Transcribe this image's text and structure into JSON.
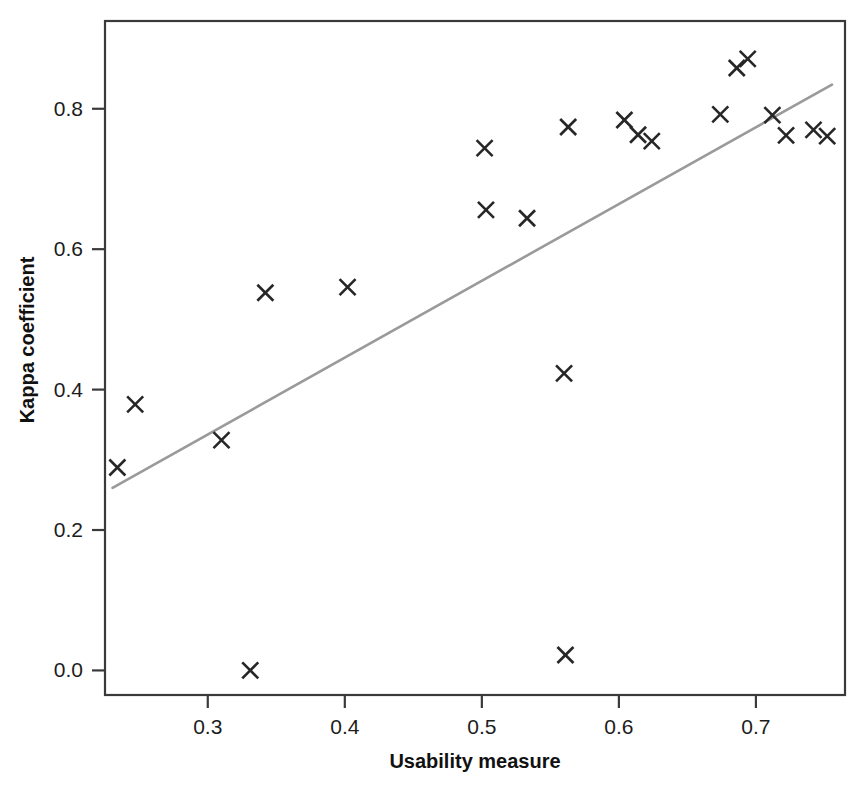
{
  "chart_data": {
    "type": "scatter",
    "title": "",
    "xlabel": "Usability measure",
    "ylabel": "Kappa coefficient",
    "xlim": [
      0.225,
      0.765
    ],
    "ylim": [
      -0.035,
      0.925
    ],
    "grid": false,
    "legend": "none",
    "xticks": [
      0.3,
      0.4,
      0.5,
      0.6,
      0.7
    ],
    "xticklabels": [
      "0.3",
      "0.4",
      "0.5",
      "0.6",
      "0.7"
    ],
    "yticks": [
      0.0,
      0.2,
      0.4,
      0.6,
      0.8
    ],
    "yticklabels": [
      "0.0",
      "0.2",
      "0.4",
      "0.6",
      "0.8"
    ],
    "marker": "x",
    "marker_color": "#262626",
    "points": [
      {
        "x": 0.234,
        "y": 0.289
      },
      {
        "x": 0.247,
        "y": 0.379
      },
      {
        "x": 0.31,
        "y": 0.328
      },
      {
        "x": 0.331,
        "y": 0.0
      },
      {
        "x": 0.342,
        "y": 0.538
      },
      {
        "x": 0.402,
        "y": 0.546
      },
      {
        "x": 0.502,
        "y": 0.744
      },
      {
        "x": 0.503,
        "y": 0.656
      },
      {
        "x": 0.533,
        "y": 0.644
      },
      {
        "x": 0.56,
        "y": 0.423
      },
      {
        "x": 0.561,
        "y": 0.022
      },
      {
        "x": 0.563,
        "y": 0.774
      },
      {
        "x": 0.604,
        "y": 0.784
      },
      {
        "x": 0.614,
        "y": 0.763
      },
      {
        "x": 0.624,
        "y": 0.754
      },
      {
        "x": 0.674,
        "y": 0.792
      },
      {
        "x": 0.686,
        "y": 0.858
      },
      {
        "x": 0.694,
        "y": 0.871
      },
      {
        "x": 0.712,
        "y": 0.791
      },
      {
        "x": 0.722,
        "y": 0.762
      },
      {
        "x": 0.742,
        "y": 0.77
      },
      {
        "x": 0.752,
        "y": 0.761
      }
    ],
    "trendline": {
      "label": "fit-line",
      "color": "#9a9a9a",
      "x_start": 0.2305,
      "y_start": 0.26,
      "x_end": 0.7555,
      "y_end": 0.8345
    }
  }
}
